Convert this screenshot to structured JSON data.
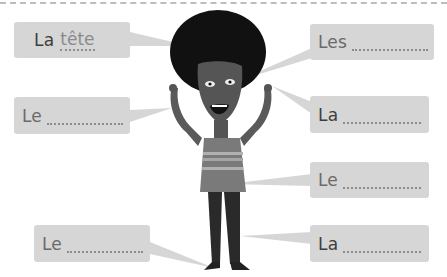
{
  "worksheet": {
    "title": "Body parts labelling exercise",
    "labels": [
      {
        "id": "head",
        "article": "La",
        "word": "tête",
        "filled": true
      },
      {
        "id": "eyes",
        "article": "Les",
        "word": "",
        "filled": false
      },
      {
        "id": "arm",
        "article": "Le",
        "word": "",
        "filled": false
      },
      {
        "id": "hand",
        "article": "La",
        "word": "",
        "filled": false
      },
      {
        "id": "sweater",
        "article": "Le",
        "word": "",
        "filled": false
      },
      {
        "id": "foot",
        "article": "Le",
        "word": "",
        "filled": false
      },
      {
        "id": "leg",
        "article": "La",
        "word": "",
        "filled": false
      }
    ]
  },
  "colors": {
    "box_bg": "#d6d6d6",
    "text": "#6a6a6a",
    "hair": "#111111",
    "skin": "#555555",
    "sweater": "#7a7a7a",
    "pants": "#2a2a2a"
  }
}
